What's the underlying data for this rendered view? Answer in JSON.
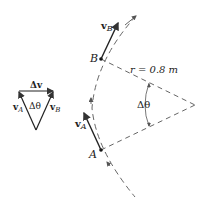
{
  "diagram": {
    "point_A_label": "A",
    "point_B_label": "B",
    "velocity_A_label": "v",
    "velocity_A_sub": "A",
    "velocity_B_label": "v",
    "velocity_B_sub": "B",
    "radius_label": "r = 0.8 m",
    "angle_label": "Δθ",
    "triangle": {
      "delta_v_label": "Δv",
      "vA_label": "v",
      "vA_sub": "A",
      "vB_label": "v",
      "vB_sub": "B",
      "angle_label": "Δθ"
    }
  }
}
